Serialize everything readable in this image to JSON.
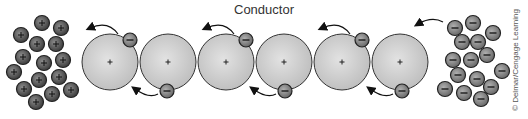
{
  "title": "Conductor",
  "credit": "© Delmar/Cengage Learning",
  "colors": {
    "atom_fill": "#cfcfcf",
    "ion_fill": "#5a5a5a",
    "electron_fill": "#8a8a8a",
    "stroke": "#333333"
  },
  "atoms": [
    {
      "cx": 110,
      "cy": 62,
      "sign": "+"
    },
    {
      "cx": 168,
      "cy": 62,
      "sign": "+"
    },
    {
      "cx": 226,
      "cy": 62,
      "sign": "+"
    },
    {
      "cx": 284,
      "cy": 62,
      "sign": "+"
    },
    {
      "cx": 342,
      "cy": 62,
      "sign": "+"
    },
    {
      "cx": 400,
      "cy": 62,
      "sign": "+"
    }
  ],
  "free_electrons": [
    {
      "cx": 130,
      "cy": 40,
      "sign": "−"
    },
    {
      "cx": 167,
      "cy": 91,
      "sign": "−"
    },
    {
      "cx": 246,
      "cy": 40,
      "sign": "−"
    },
    {
      "cx": 285,
      "cy": 91,
      "sign": "−"
    },
    {
      "cx": 362,
      "cy": 40,
      "sign": "−"
    },
    {
      "cx": 402,
      "cy": 91,
      "sign": "−"
    }
  ],
  "positive_charges": [
    [
      42,
      23
    ],
    [
      61,
      28
    ],
    [
      21,
      35
    ],
    [
      37,
      44
    ],
    [
      56,
      44
    ],
    [
      23,
      57
    ],
    [
      44,
      63
    ],
    [
      63,
      60
    ],
    [
      14,
      72
    ],
    [
      39,
      80
    ],
    [
      59,
      77
    ],
    [
      24,
      89
    ],
    [
      52,
      94
    ],
    [
      71,
      90
    ],
    [
      36,
      102
    ]
  ],
  "negative_charges": [
    [
      473,
      23
    ],
    [
      455,
      28
    ],
    [
      493,
      33
    ],
    [
      462,
      42
    ],
    [
      478,
      42
    ],
    [
      487,
      55
    ],
    [
      453,
      60
    ],
    [
      471,
      60
    ],
    [
      502,
      71
    ],
    [
      458,
      75
    ],
    [
      477,
      79
    ],
    [
      491,
      87
    ],
    [
      445,
      89
    ],
    [
      464,
      93
    ],
    [
      481,
      99
    ]
  ]
}
